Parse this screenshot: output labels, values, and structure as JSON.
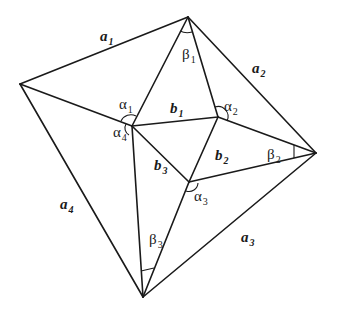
{
  "diagram": {
    "type": "geometric-figure",
    "vertices": {
      "T": [
        188,
        17
      ],
      "L": [
        20,
        84
      ],
      "R": [
        316,
        153
      ],
      "B": [
        143,
        297
      ],
      "P1": [
        132,
        126
      ],
      "P2": [
        218,
        117
      ],
      "P3": [
        189,
        182
      ]
    },
    "edges": [
      {
        "id": "a1",
        "from": "L",
        "to": "T"
      },
      {
        "id": "a2",
        "from": "T",
        "to": "R"
      },
      {
        "id": "a3",
        "from": "R",
        "to": "B"
      },
      {
        "id": "a4",
        "from": "B",
        "to": "L"
      },
      {
        "id": "L-P1",
        "from": "L",
        "to": "P1"
      },
      {
        "id": "T-P1",
        "from": "T",
        "to": "P1"
      },
      {
        "id": "T-P2",
        "from": "T",
        "to": "P2"
      },
      {
        "id": "R-P2",
        "from": "R",
        "to": "P2"
      },
      {
        "id": "R-P3",
        "from": "R",
        "to": "P3"
      },
      {
        "id": "B-P1",
        "from": "B",
        "to": "P1"
      },
      {
        "id": "B-P3",
        "from": "B",
        "to": "P3"
      },
      {
        "id": "b1",
        "from": "P1",
        "to": "P2"
      },
      {
        "id": "b2",
        "from": "P2",
        "to": "P3"
      },
      {
        "id": "b3",
        "from": "P3",
        "to": "P1"
      }
    ],
    "side_labels": [
      {
        "id": "a1",
        "base": "a",
        "sub": "1",
        "x": 100,
        "y": 41
      },
      {
        "id": "a2",
        "base": "a",
        "sub": "2",
        "x": 252,
        "y": 73
      },
      {
        "id": "a3",
        "base": "a",
        "sub": "3",
        "x": 241,
        "y": 242
      },
      {
        "id": "a4",
        "base": "a",
        "sub": "4",
        "x": 60,
        "y": 209
      },
      {
        "id": "b1",
        "base": "b",
        "sub": "1",
        "x": 170,
        "y": 113
      },
      {
        "id": "b2",
        "base": "b",
        "sub": "2",
        "x": 215,
        "y": 160
      },
      {
        "id": "b3",
        "base": "b",
        "sub": "3",
        "x": 154,
        "y": 170
      }
    ],
    "angle_labels": [
      {
        "id": "alpha1",
        "base": "α",
        "sub": "1",
        "x": 119,
        "y": 109
      },
      {
        "id": "alpha2",
        "base": "α",
        "sub": "2",
        "x": 224,
        "y": 111
      },
      {
        "id": "alpha3",
        "base": "α",
        "sub": "3",
        "x": 194,
        "y": 201
      },
      {
        "id": "alpha4",
        "base": "α",
        "sub": "4",
        "x": 113,
        "y": 137
      },
      {
        "id": "beta1",
        "base": "β",
        "sub": "1",
        "x": 182,
        "y": 59
      },
      {
        "id": "beta2",
        "base": "β",
        "sub": "2",
        "x": 267,
        "y": 159
      },
      {
        "id": "beta3",
        "base": "β",
        "sub": "3",
        "x": 149,
        "y": 244
      }
    ]
  }
}
